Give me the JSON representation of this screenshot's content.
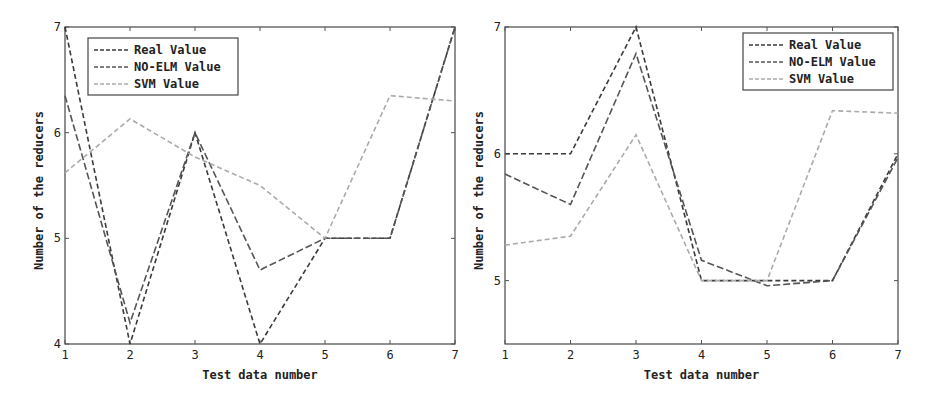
{
  "chart_data": [
    {
      "type": "line",
      "title": "",
      "xlabel": "Test data number",
      "ylabel": "Number of the reducers",
      "x": [
        1,
        2,
        3,
        4,
        5,
        6,
        7
      ],
      "xlim": [
        1,
        7
      ],
      "ylim": [
        4,
        7
      ],
      "xticks": [
        "1",
        "2",
        "3",
        "4",
        "5",
        "6",
        "7"
      ],
      "yticks": [
        "4",
        "5",
        "6",
        "7"
      ],
      "grid": false,
      "legend_position": "upper left",
      "series": [
        {
          "name": "Real Value",
          "values": [
            7,
            4,
            6,
            4,
            5,
            5,
            7
          ],
          "color": "#3a3a3a",
          "dash": "5,3"
        },
        {
          "name": "NO-ELM Value",
          "values": [
            6.35,
            4.2,
            6.0,
            4.7,
            5.0,
            5.0,
            7.0
          ],
          "color": "#555555",
          "dash": "7,3"
        },
        {
          "name": "SVM Value",
          "values": [
            5.62,
            6.13,
            5.77,
            5.5,
            5.0,
            6.35,
            6.3
          ],
          "color": "#aaaaaa",
          "dash": "5,3"
        }
      ]
    },
    {
      "type": "line",
      "title": "",
      "xlabel": "Test data number",
      "ylabel": "Number of the reducers",
      "x": [
        1,
        2,
        3,
        4,
        5,
        6,
        7
      ],
      "xlim": [
        1,
        7
      ],
      "ylim": [
        4.5,
        7
      ],
      "xticks": [
        "1",
        "2",
        "3",
        "4",
        "5",
        "6",
        "7"
      ],
      "yticks": [
        "5",
        "6",
        "7"
      ],
      "grid": false,
      "legend_position": "upper right",
      "series": [
        {
          "name": "Real Value",
          "values": [
            6,
            6,
            7,
            5,
            5,
            5,
            6
          ],
          "color": "#3a3a3a",
          "dash": "5,3"
        },
        {
          "name": "NO-ELM Value",
          "values": [
            5.84,
            5.6,
            6.79,
            5.16,
            4.96,
            5.0,
            5.97
          ],
          "color": "#555555",
          "dash": "7,3"
        },
        {
          "name": "SVM Value",
          "values": [
            5.28,
            5.35,
            6.15,
            5.0,
            5.0,
            6.34,
            6.32
          ],
          "color": "#aaaaaa",
          "dash": "5,3"
        }
      ]
    }
  ],
  "charts": [
    {
      "xlabel": "Test data number",
      "ylabel": "Number of the reducers",
      "legend": [
        "Real Value",
        "NO-ELM Value",
        "SVM Value"
      ]
    },
    {
      "xlabel": "Test data number",
      "ylabel": "Number of the reducers",
      "legend": [
        "Real Value",
        "NO-ELM Value",
        "SVM Value"
      ]
    }
  ]
}
